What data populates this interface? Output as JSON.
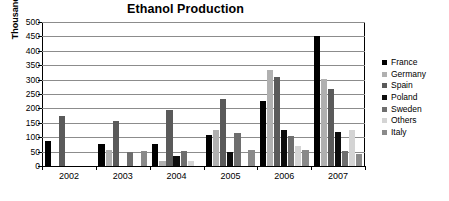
{
  "chart_data": {
    "type": "bar",
    "title": "Ethanol Production",
    "xlabel": "",
    "ylabel": "Thousand tons",
    "ylim": [
      0,
      500
    ],
    "ytick_step": 50,
    "yticks": [
      500,
      450,
      400,
      350,
      300,
      250,
      200,
      150,
      100,
      50,
      0
    ],
    "grid": true,
    "legend_position": "right",
    "categories": [
      "2002",
      "2003",
      "2004",
      "2005",
      "2006",
      "2007"
    ],
    "series": [
      {
        "name": "France",
        "color": "#000000",
        "values": [
          87,
          78,
          75,
          108,
          225,
          452
        ]
      },
      {
        "name": "Germany",
        "color": "#b0b0b0",
        "values": [
          0,
          56,
          16,
          126,
          335,
          303
        ]
      },
      {
        "name": "Spain",
        "color": "#5a5a5a",
        "values": [
          175,
          157,
          196,
          233,
          308,
          268
        ]
      },
      {
        "name": "Poland",
        "color": "#0d0d0d",
        "values": [
          0,
          0,
          35,
          48,
          125,
          118
        ]
      },
      {
        "name": "Sweden",
        "color": "#6e6e6e",
        "values": [
          0,
          50,
          52,
          115,
          105,
          51
        ]
      },
      {
        "name": "Others",
        "color": "#d4d4d4",
        "values": [
          0,
          0,
          18,
          0,
          68,
          124
        ]
      },
      {
        "name": "Italy",
        "color": "#8a8a8a",
        "values": [
          0,
          52,
          0,
          55,
          55,
          40
        ]
      }
    ]
  },
  "legend": {
    "items": [
      {
        "label": "France"
      },
      {
        "label": "Germany"
      },
      {
        "label": "Spain"
      },
      {
        "label": "Poland"
      },
      {
        "label": "Sweden"
      },
      {
        "label": "Others"
      },
      {
        "label": "Italy"
      }
    ]
  }
}
